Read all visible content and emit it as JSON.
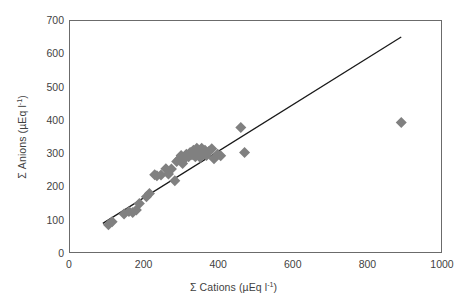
{
  "chart_data": {
    "type": "scatter",
    "title": "",
    "xlabel": "Σ Cations (µEq l",
    "xlabel_sup": "-1",
    "xlabel_tail": ")",
    "ylabel": "Σ Anions (µEq l",
    "ylabel_sup": "-1",
    "ylabel_tail": ")",
    "xlabel_full": "Σ Cations (µEq l-1)",
    "ylabel_full": "Σ Anions (µEq l-1)",
    "xlim": [
      0,
      1000
    ],
    "ylim": [
      0,
      700
    ],
    "xticks": [
      0,
      200,
      400,
      600,
      800,
      1000
    ],
    "yticks": [
      0,
      100,
      200,
      300,
      400,
      500,
      600,
      700
    ],
    "xtick_labels": [
      "0",
      "200",
      "400",
      "600",
      "800",
      "1000"
    ],
    "ytick_labels": [
      "0",
      "100",
      "200",
      "300",
      "400",
      "500",
      "600",
      "700"
    ],
    "grid": false,
    "legend": "none",
    "marker": "diamond",
    "marker_color": "#808080",
    "marker_size": 11,
    "frame_color": "#6b6b6b",
    "line_color": "#1a1a1a",
    "series": [
      {
        "name": "Samples",
        "points": [
          [
            103,
            88
          ],
          [
            113,
            97
          ],
          [
            145,
            120
          ],
          [
            158,
            128
          ],
          [
            168,
            125
          ],
          [
            178,
            132
          ],
          [
            186,
            152
          ],
          [
            205,
            172
          ],
          [
            213,
            182
          ],
          [
            227,
            238
          ],
          [
            233,
            235
          ],
          [
            244,
            237
          ],
          [
            257,
            256
          ],
          [
            264,
            240
          ],
          [
            272,
            255
          ],
          [
            281,
            220
          ],
          [
            286,
            278
          ],
          [
            292,
            284
          ],
          [
            298,
            296
          ],
          [
            302,
            272
          ],
          [
            308,
            287
          ],
          [
            312,
            300
          ],
          [
            318,
            292
          ],
          [
            322,
            305
          ],
          [
            327,
            298
          ],
          [
            331,
            312
          ],
          [
            336,
            292
          ],
          [
            340,
            318
          ],
          [
            345,
            305
          ],
          [
            349,
            290
          ],
          [
            353,
            318
          ],
          [
            358,
            300
          ],
          [
            362,
            312
          ],
          [
            366,
            296
          ],
          [
            372,
            308
          ],
          [
            380,
            316
          ],
          [
            386,
            286
          ],
          [
            396,
            300
          ],
          [
            404,
            295
          ],
          [
            458,
            380
          ],
          [
            468,
            305
          ],
          [
            888,
            395
          ]
        ]
      }
    ],
    "trendline": {
      "name": "1:1 regression line",
      "x_start": 88,
      "y_start": 92,
      "x_end": 888,
      "y_end": 652
    }
  }
}
